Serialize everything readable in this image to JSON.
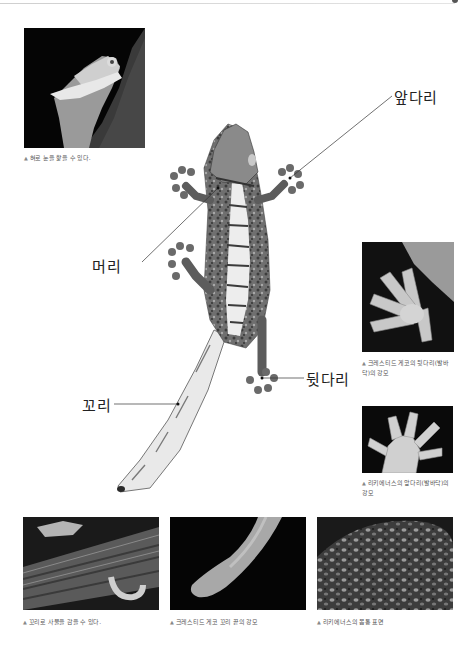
{
  "page": {
    "background": "#ffffff",
    "rule_color": "#d0d0d0"
  },
  "photos": {
    "tongue_eye": {
      "caption": "혀로 눈을 핥을 수 있다.",
      "icon": "triangle-up-icon"
    },
    "hind_foot": {
      "caption": "크레스티드 게코의 뒷다리(발바닥)의 강모",
      "icon": "triangle-up-icon"
    },
    "front_foot": {
      "caption": "리키에너스의 앞다리(발바닥)의 강모",
      "icon": "triangle-up-icon"
    },
    "tail_grip": {
      "caption": "꼬리로 사물을 감을 수 있다.",
      "icon": "triangle-up-icon"
    },
    "tail_tip": {
      "caption": "크레스티드 게코 꼬리 끝의 강모",
      "icon": "triangle-up-icon"
    },
    "body_surface": {
      "caption": "리키에너스의 몸통 표면",
      "icon": "triangle-up-icon"
    }
  },
  "diagram": {
    "labels": {
      "front_leg": "앞다리",
      "head": "머리",
      "hind_leg": "뒷다리",
      "tail": "꼬리"
    }
  },
  "icons": {
    "caption_marker": "▲"
  }
}
